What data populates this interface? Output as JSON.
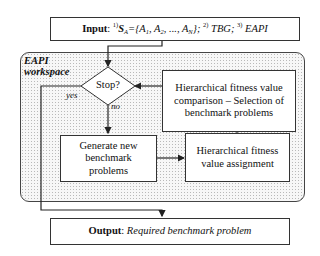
{
  "input": {
    "label": "Input",
    "sep": ": ",
    "item1_num": "1)",
    "item1_S": "S",
    "item1_S_sub": "A",
    "item1_eq": "={",
    "item1_A1": "A",
    "item1_A1_sub": "1",
    "item1_A2": ", A",
    "item1_A2_sub": "2",
    "item1_dots": ", ..., A",
    "item1_AN_sub": "N",
    "item1_close": "}; ",
    "item2_num": "2)",
    "item2_text": " TBG; ",
    "item3_num": "3)",
    "item3_text": " EAPI"
  },
  "workspace": {
    "label_line1": "EAPI",
    "label_line2": "workspace"
  },
  "nodes": {
    "stop": "Stop?",
    "comparison": "Hierarchical fitness value comparison – Selection of benchmark problems",
    "generate": "Generate new benchmark problems",
    "assignment": "Hierarchical fitness value assignment"
  },
  "edge_labels": {
    "yes": "yes",
    "no": "no"
  },
  "output": {
    "label": "Output",
    "sep": ": ",
    "text": "Required benchmark problem"
  }
}
